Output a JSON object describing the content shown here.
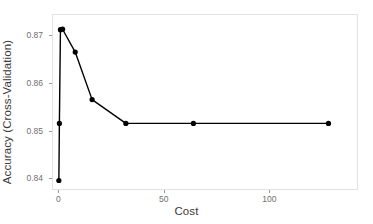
{
  "chart_data": {
    "type": "line",
    "title": "",
    "subtitle": "",
    "xlabel": "Cost",
    "ylabel": "Accuracy (Cross-Validation)",
    "xlim": [
      -3,
      142
    ],
    "ylim": [
      0.8375,
      0.8745
    ],
    "grid": false,
    "legend": null,
    "marker": "filled-circle",
    "line_color": "#000000",
    "point_color": "#000000",
    "panel_background": "#ffffff",
    "panel_border_color": "#e2e2e2",
    "x": [
      0.25,
      0.5,
      1,
      2,
      8,
      16,
      32,
      64,
      128
    ],
    "y": [
      0.8395,
      0.8515,
      0.8712,
      0.8713,
      0.8665,
      0.8565,
      0.8515,
      0.8515,
      0.8515
    ],
    "series": [
      {
        "name": "Accuracy (Cross-Validation)",
        "values": [
          0.8395,
          0.8515,
          0.8712,
          0.8713,
          0.8665,
          0.8565,
          0.8515,
          0.8515,
          0.8515
        ]
      }
    ],
    "xticks": [
      0,
      50,
      100
    ],
    "xtick_labels": [
      "0",
      "50",
      "100"
    ],
    "yticks": [
      0.84,
      0.85,
      0.86,
      0.87
    ],
    "ytick_labels": [
      "0.84",
      "0.85",
      "0.86",
      "0.87"
    ]
  },
  "axis": {
    "x_title": "Cost",
    "y_title": "Accuracy (Cross-Validation)"
  }
}
